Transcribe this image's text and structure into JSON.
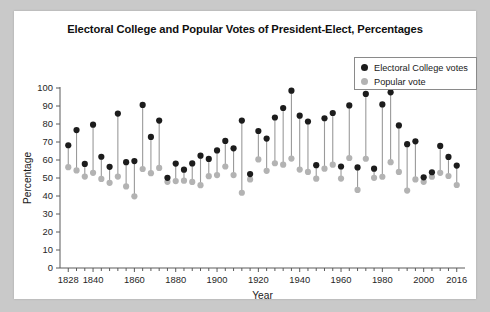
{
  "card": {
    "background": "#ffffff",
    "page_background": "#c9c9c9"
  },
  "chart_data": {
    "type": "scatter",
    "title": "Electoral College and Popular Votes of President-Elect, Percentages",
    "subtitle": "",
    "xlabel": "Year",
    "ylabel": "Percentage",
    "xlim": [
      1824,
      2020
    ],
    "ylim": [
      0,
      100
    ],
    "grid": false,
    "legend_position": "top-right",
    "colors": {
      "electoral": "#1c1c1c",
      "popular": "#b3b3b3",
      "stem": "#9a9a9a"
    },
    "ytick_labels": [
      "0",
      "10",
      "20",
      "30",
      "40",
      "50",
      "60",
      "70",
      "80",
      "90",
      "100"
    ],
    "yticks": [
      0,
      10,
      20,
      30,
      40,
      50,
      60,
      70,
      80,
      90,
      100
    ],
    "xtick_labels": [
      "1828",
      "1840",
      "1860",
      "1880",
      "1900",
      "1920",
      "1940",
      "1960",
      "1980",
      "2000",
      "2016"
    ],
    "xticks": [
      1828,
      1840,
      1860,
      1880,
      1900,
      1920,
      1940,
      1960,
      1980,
      2000,
      2016
    ],
    "xticks_minor": [
      1832,
      1836,
      1844,
      1848,
      1852,
      1856,
      1864,
      1868,
      1872,
      1876,
      1884,
      1888,
      1892,
      1896,
      1904,
      1908,
      1912,
      1916,
      1924,
      1928,
      1932,
      1936,
      1944,
      1948,
      1952,
      1956,
      1964,
      1968,
      1972,
      1976,
      1988,
      1992,
      1996,
      2004,
      2008,
      2012
    ],
    "legend": [
      {
        "name": "electoral-college-votes",
        "label": "Electoral College votes",
        "color": "#1c1c1c"
      },
      {
        "name": "popular-vote",
        "label": "Popular vote",
        "color": "#b3b3b3"
      }
    ],
    "x": [
      1828,
      1832,
      1836,
      1840,
      1844,
      1848,
      1852,
      1856,
      1860,
      1864,
      1868,
      1872,
      1876,
      1880,
      1884,
      1888,
      1892,
      1896,
      1900,
      1904,
      1908,
      1912,
      1916,
      1920,
      1924,
      1928,
      1932,
      1936,
      1940,
      1944,
      1948,
      1952,
      1956,
      1960,
      1964,
      1968,
      1972,
      1976,
      1980,
      1984,
      1988,
      1992,
      1996,
      2000,
      2004,
      2008,
      2012,
      2016
    ],
    "series": [
      {
        "name": "Electoral College votes",
        "key": "electoral",
        "values": [
          68.2,
          76.6,
          57.8,
          79.6,
          61.8,
          56.2,
          85.8,
          58.8,
          59.4,
          90.6,
          72.8,
          81.9,
          50.1,
          58.0,
          54.6,
          58.1,
          62.4,
          60.6,
          65.3,
          70.6,
          66.5,
          81.9,
          52.2,
          76.1,
          71.9,
          83.6,
          88.9,
          98.5,
          84.6,
          81.4,
          57.1,
          83.2,
          86.1,
          56.4,
          90.3,
          55.9,
          96.7,
          55.2,
          90.9,
          97.6,
          79.2,
          68.8,
          70.4,
          50.4,
          53.2,
          67.8,
          61.7,
          56.9
        ]
      },
      {
        "name": "Popular vote",
        "key": "popular",
        "values": [
          56.0,
          54.2,
          50.8,
          52.9,
          49.5,
          47.3,
          50.8,
          45.3,
          39.8,
          55.0,
          52.7,
          55.6,
          47.9,
          48.3,
          48.5,
          47.8,
          46.0,
          51.0,
          51.6,
          56.4,
          51.6,
          41.8,
          49.2,
          60.3,
          54.0,
          58.2,
          57.4,
          60.8,
          54.7,
          53.4,
          49.6,
          55.2,
          57.4,
          49.7,
          61.1,
          43.4,
          60.7,
          50.1,
          50.7,
          58.8,
          53.4,
          43.0,
          49.2,
          47.9,
          50.7,
          52.9,
          51.1,
          46.1
        ]
      }
    ]
  }
}
